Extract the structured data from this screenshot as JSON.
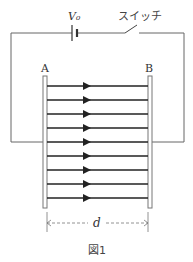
{
  "figure": {
    "caption": "図1",
    "battery_label": "V₀",
    "switch_label": "スイッチ",
    "plate_a_label": "A",
    "plate_b_label": "B",
    "distance_label": "d",
    "field_line_count": 9,
    "field_direction": "A to B"
  },
  "colors": {
    "wire": "#666666",
    "field_line": "#222222",
    "plate": "#777777"
  }
}
